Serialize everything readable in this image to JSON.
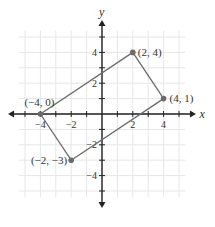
{
  "chart_data": {
    "type": "scatter",
    "title": "",
    "xlabel": "x",
    "ylabel": "y",
    "xlim": [
      -6,
      6
    ],
    "ylim": [
      -6,
      6
    ],
    "grid": true,
    "x_ticks": [
      -4,
      -2,
      2,
      4
    ],
    "x_tick_labels": [
      "−4",
      "−2",
      "2",
      "4"
    ],
    "y_ticks": [
      4,
      2,
      -2,
      -4
    ],
    "y_tick_labels": [
      "4",
      "2",
      "−2",
      "−4"
    ],
    "points": [
      {
        "x": -4,
        "y": 0,
        "label": "(−4, 0)"
      },
      {
        "x": 2,
        "y": 4,
        "label": "(2, 4)"
      },
      {
        "x": 4,
        "y": 1,
        "label": "(4, 1)"
      },
      {
        "x": -2,
        "y": -3,
        "label": "(−2, −3)"
      }
    ],
    "polygon_order": [
      0,
      1,
      2,
      3
    ],
    "colors": {
      "line": "#6b6b6b",
      "point": "#6b6b6b",
      "axis": "#222222",
      "grid": "#e6e6e6"
    }
  }
}
